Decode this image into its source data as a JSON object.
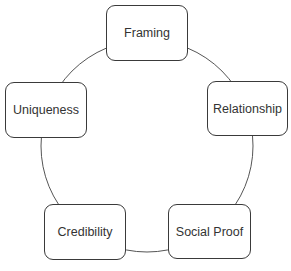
{
  "diagram": {
    "type": "cycle",
    "ring_color": "#555555",
    "nodes": [
      {
        "id": "framing",
        "label": "Framing"
      },
      {
        "id": "relationship",
        "label": "Relationship"
      },
      {
        "id": "social-proof",
        "label": "Social Proof"
      },
      {
        "id": "credibility",
        "label": "Credibility"
      },
      {
        "id": "uniqueness",
        "label": "Uniqueness"
      }
    ]
  }
}
